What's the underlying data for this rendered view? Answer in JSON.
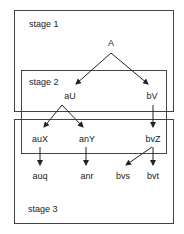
{
  "diagram": {
    "stages": [
      {
        "label": "stage 1",
        "box": {
          "x": 14.5,
          "y": 10.5,
          "w": 159,
          "h": 101
        },
        "label_pos": {
          "x": 29,
          "y": 27
        }
      },
      {
        "label": "stage 2",
        "box": {
          "x": 21.5,
          "y": 70.5,
          "w": 145,
          "h": 83
        },
        "label_pos": {
          "x": 29,
          "y": 85
        }
      },
      {
        "label": "stage 3",
        "box": {
          "x": 14.5,
          "y": 119.5,
          "w": 159,
          "h": 104
        },
        "label_pos": {
          "x": 28,
          "y": 212
        }
      }
    ],
    "nodes": [
      {
        "id": "A",
        "label": "A",
        "x": 111,
        "y": 46
      },
      {
        "id": "aU",
        "label": "aU",
        "x": 70,
        "y": 99
      },
      {
        "id": "bV",
        "label": "bV",
        "x": 152,
        "y": 99
      },
      {
        "id": "auX",
        "label": "auX",
        "x": 40,
        "y": 142
      },
      {
        "id": "anY",
        "label": "anY",
        "x": 87,
        "y": 142
      },
      {
        "id": "bvZ",
        "label": "bvZ",
        "x": 153,
        "y": 142
      },
      {
        "id": "auq",
        "label": "auq",
        "x": 40,
        "y": 179
      },
      {
        "id": "anr",
        "label": "anr",
        "x": 87,
        "y": 179
      },
      {
        "id": "bvs",
        "label": "bvs",
        "x": 123,
        "y": 179
      },
      {
        "id": "bvt",
        "label": "bvt",
        "x": 153,
        "y": 179
      }
    ],
    "edges": [
      {
        "from": "A",
        "to": "aU",
        "x1": 111,
        "y1": 53,
        "x2": 76,
        "y2": 84
      },
      {
        "from": "A",
        "to": "bV",
        "x1": 111,
        "y1": 53,
        "x2": 148,
        "y2": 84
      },
      {
        "from": "aU",
        "to": "auX",
        "x1": 62,
        "y1": 105,
        "x2": 44,
        "y2": 127
      },
      {
        "from": "aU",
        "to": "anY",
        "x1": 62,
        "y1": 105,
        "x2": 83,
        "y2": 127
      },
      {
        "from": "bV",
        "to": "bvZ",
        "x1": 153,
        "y1": 105,
        "x2": 153,
        "y2": 127
      },
      {
        "from": "auX",
        "to": "auq",
        "x1": 40,
        "y1": 147,
        "x2": 40,
        "y2": 165
      },
      {
        "from": "anY",
        "to": "anr",
        "x1": 86,
        "y1": 147,
        "x2": 86,
        "y2": 165
      },
      {
        "from": "bvZ",
        "to": "bvs",
        "x1": 152,
        "y1": 147,
        "x2": 126,
        "y2": 165
      },
      {
        "from": "bvZ",
        "to": "bvt",
        "x1": 153,
        "y1": 147,
        "x2": 153,
        "y2": 165
      }
    ],
    "colors": {
      "box_stroke": "#444444",
      "edge": "#222222",
      "text": "#222222",
      "background": "#ffffff"
    }
  }
}
